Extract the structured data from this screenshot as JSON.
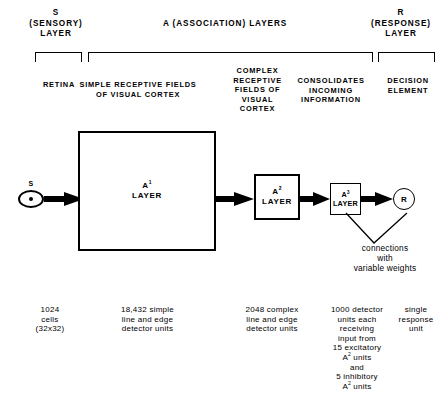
{
  "figure": {
    "type": "block-diagram"
  },
  "header": {
    "sensory": "S\n(SENSORY)\nLAYER",
    "association": "A (ASSOCIATION) LAYERS",
    "response": "R\n(RESPONSE)\nLAYER"
  },
  "column_headers": [
    {
      "id": "retina",
      "text": "RETINA"
    },
    {
      "id": "simple-receptive",
      "text": "SIMPLE RECEPTIVE FIELDS\nOF VISUAL CORTEX"
    },
    {
      "id": "complex-receptive",
      "text": "COMPLEX\nRECEPTIVE\nFIELDS OF\nVISUAL\nCORTEX"
    },
    {
      "id": "consolidates",
      "text": "CONSOLIDATES\nINCOMING\nINFORMATION"
    },
    {
      "id": "decision",
      "text": "DECISION\nELEMENT"
    }
  ],
  "diagram": {
    "stimulus_label": "S",
    "a1_label_base": "A",
    "a1_label_sup": "1",
    "a1_label_tail": "LAYER",
    "a2_label_base": "A",
    "a2_label_sup": "2",
    "a2_label_tail": "LAYER",
    "a3_label_base": "A",
    "a3_label_sup": "3",
    "a3_label_tail": "LAYER",
    "response_label": "R",
    "annotation": "connections\nwith\nvariable weights"
  },
  "captions": [
    {
      "id": "retina-caption",
      "text": "1024\ncells\n(32x32)"
    },
    {
      "id": "a1-caption",
      "text": "18,432  simple\nline and  edge\ndetector units"
    },
    {
      "id": "a2-caption",
      "text": "2048 complex\nline and edge\ndetector units"
    },
    {
      "id": "a3-caption-line1",
      "text": "1000 detector\nunits each\nreceiving\ninput from\n15 excitatory"
    },
    {
      "id": "a3-caption-sup1-base",
      "text": "A"
    },
    {
      "id": "a3-caption-sup1-sup",
      "text": "2"
    },
    {
      "id": "a3-caption-sup1-tail",
      "text": " units"
    },
    {
      "id": "a3-caption-line2",
      "text": "and\n5 inhibitory"
    },
    {
      "id": "a3-caption-sup2-base",
      "text": "A"
    },
    {
      "id": "a3-caption-sup2-sup",
      "text": "2"
    },
    {
      "id": "a3-caption-sup2-tail",
      "text": " units"
    },
    {
      "id": "r-caption",
      "text": "single\nresponse\nunit"
    }
  ],
  "colors": {
    "ink": "#000000",
    "paper": "#ffffff"
  }
}
